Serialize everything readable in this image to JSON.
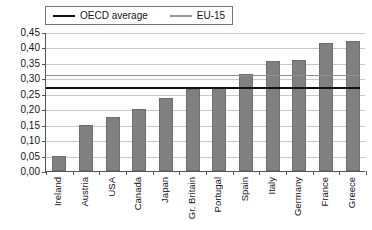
{
  "chart_data": {
    "type": "bar",
    "title": "",
    "subtitle": "",
    "xlabel": "",
    "ylabel": "",
    "categories": [
      "Ireland",
      "Austria",
      "USA",
      "Canada",
      "Japan",
      "Gr. Britain",
      "Portugal",
      "Spain",
      "Italy",
      "Germany",
      "France",
      "Greece"
    ],
    "values": [
      0.05,
      0.15,
      0.175,
      0.2,
      0.235,
      0.265,
      0.27,
      0.315,
      0.355,
      0.36,
      0.415,
      0.42
    ],
    "series": [
      {
        "name": "country-values",
        "values": [
          0.05,
          0.15,
          0.175,
          0.2,
          0.235,
          0.265,
          0.27,
          0.315,
          0.355,
          0.36,
          0.415,
          0.42
        ]
      }
    ],
    "reference_lines": [
      {
        "name": "OECD average",
        "value": 0.275,
        "color": "#101010",
        "style": "solid",
        "width": 2
      },
      {
        "name": "EU-15",
        "value": 0.315,
        "color": "#8f8f8f",
        "style": "solid",
        "width": 1
      }
    ],
    "ylim": [
      0,
      0.45
    ],
    "ytick_values": [
      0.0,
      0.05,
      0.1,
      0.15,
      0.2,
      0.25,
      0.3,
      0.35,
      0.4,
      0.45
    ],
    "ytick_labels": [
      "0,00",
      "0,05",
      "0,10",
      "0,15",
      "0,20",
      "0,25",
      "0,30",
      "0,35",
      "0,40",
      "0,45"
    ],
    "grid": true,
    "grid_axis": "y",
    "legend_position": "top",
    "bar_color": "#808080",
    "decimal_separator": ","
  },
  "legend": {
    "entries": [
      {
        "label": "OECD average",
        "color": "#101010"
      },
      {
        "label": "EU-15",
        "color": "#8f8f8f"
      }
    ]
  }
}
